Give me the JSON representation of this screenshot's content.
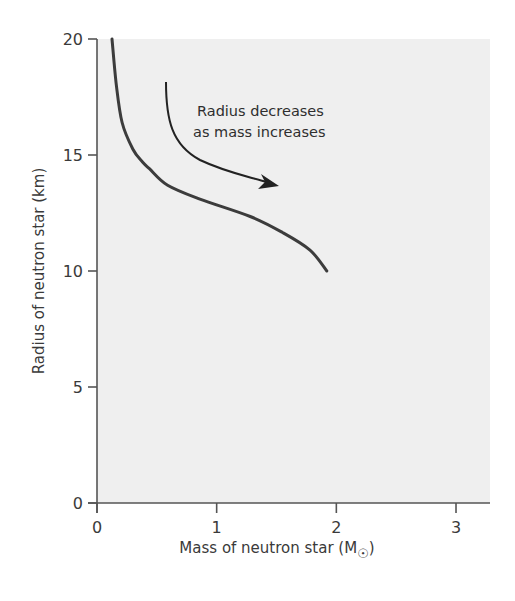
{
  "chart_data": {
    "type": "line",
    "title": "",
    "xlabel": "Mass of neutron star (M☉)",
    "xlabel_main": "Mass of neutron star (M",
    "xlabel_sub": "☉",
    "xlabel_close": ")",
    "ylabel": "Radius of neutron star (km)",
    "xlim": [
      0,
      3.3
    ],
    "ylim": [
      0,
      20
    ],
    "xticks": [
      0,
      1,
      2,
      3
    ],
    "yticks": [
      0,
      5,
      10,
      15,
      20
    ],
    "xtick_labels": [
      "0",
      "1",
      "2",
      "3"
    ],
    "ytick_labels": [
      "0",
      "5",
      "10",
      "15",
      "20"
    ],
    "grid": false,
    "legend": null,
    "series": [
      {
        "name": "Neutron star mass-radius relation",
        "x": [
          0.125,
          0.16,
          0.21,
          0.3,
          0.38,
          0.44,
          0.59,
          0.86,
          1.28,
          1.55,
          1.78,
          1.92
        ],
        "y": [
          20.0,
          18.1,
          16.4,
          15.25,
          14.7,
          14.4,
          13.7,
          13.1,
          12.35,
          11.66,
          10.9,
          10.0
        ]
      }
    ],
    "annotations": [
      {
        "text_lines": [
          "Radius decreases",
          "as mass increases"
        ],
        "arrow": {
          "from": [
            0.58,
            18.5
          ],
          "to": [
            1.52,
            13.6
          ]
        }
      }
    ]
  },
  "colors": {
    "plot_background": "#efefef",
    "page_background": "#ffffff",
    "curve": "#3c3c3c",
    "axis": "#555555",
    "text": "#3a3a3a"
  }
}
